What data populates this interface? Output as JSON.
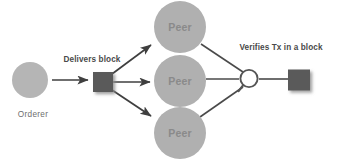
{
  "diagram": {
    "canvas": {
      "width": 342,
      "height": 160,
      "background": "#ffffff"
    },
    "colors": {
      "peer_fill": "#b0b0b0",
      "orderer_fill": "#b5b5b5",
      "block_fill": "#5a5a5a",
      "arrow_stroke": "#4a4a4a",
      "link_stroke": "#4a4a4a",
      "magnifier_stroke": "#555555",
      "node_label_text": "#8a8a8a",
      "caption_text": "#4a4a4a",
      "entity_text": "#6e6e6e"
    },
    "nodes": {
      "orderer": {
        "label": "Orderer",
        "shape": "circle",
        "cx": 30,
        "cy": 80,
        "r": 18
      },
      "delivered_block": {
        "label": "block",
        "shape": "square",
        "x": 93,
        "y": 72,
        "w": 20,
        "h": 20
      },
      "peers": [
        {
          "label": "Peer",
          "cx": 180,
          "cy": 27,
          "r": 26
        },
        {
          "label": "Peer",
          "cx": 180,
          "cy": 81,
          "r": 26
        },
        {
          "label": "Peer",
          "cx": 180,
          "cy": 133,
          "r": 26
        }
      ],
      "magnifier": {
        "label": "magnifier",
        "cx": 249,
        "cy": 79,
        "r": 9
      },
      "verified_block": {
        "label": "block",
        "shape": "square",
        "x": 288,
        "y": 70,
        "w": 22,
        "h": 21
      }
    },
    "captions": {
      "delivers_block": {
        "text": "Delivers block",
        "x": 92,
        "y": 60
      },
      "verifies_tx": {
        "text": "Verifies Tx in a block",
        "x": 281,
        "y": 48
      }
    },
    "labels": {
      "orderer_caption": {
        "text": "Orderer",
        "x": 33,
        "y": 115
      },
      "peer_top": "Peer",
      "peer_middle": "Peer",
      "peer_bottom": "Peer"
    },
    "edges": [
      {
        "name": "orderer-to-block",
        "from": "orderer",
        "to": "delivered_block",
        "arrow": true
      },
      {
        "name": "block-to-peer-top",
        "from": "delivered_block",
        "to": "peer-top",
        "arrow": true
      },
      {
        "name": "block-to-peer-middle",
        "from": "delivered_block",
        "to": "peer-middle",
        "arrow": true
      },
      {
        "name": "block-to-peer-bottom",
        "from": "delivered_block",
        "to": "peer-bottom",
        "arrow": true
      },
      {
        "name": "peer-top-to-magnifier",
        "from": "peer-top",
        "to": "magnifier",
        "arrow": false
      },
      {
        "name": "peer-middle-to-magnifier",
        "from": "peer-middle",
        "to": "magnifier",
        "arrow": false
      },
      {
        "name": "peer-bottom-to-magnifier",
        "from": "peer-bottom",
        "to": "magnifier",
        "arrow": false
      },
      {
        "name": "magnifier-to-block",
        "from": "magnifier",
        "to": "verified_block",
        "arrow": false
      }
    ]
  }
}
